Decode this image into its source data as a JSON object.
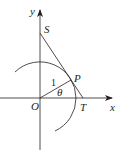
{
  "diagram": {
    "type": "unit-circle-tangent",
    "axes": {
      "x_label": "x",
      "y_label": "y",
      "origin_label": "O"
    },
    "points": {
      "S": "S",
      "P": "P",
      "T": "T"
    },
    "radius_label": "1",
    "angle_label": "θ",
    "colors": {
      "stroke": "#231f20",
      "background": "#ffffff"
    }
  }
}
